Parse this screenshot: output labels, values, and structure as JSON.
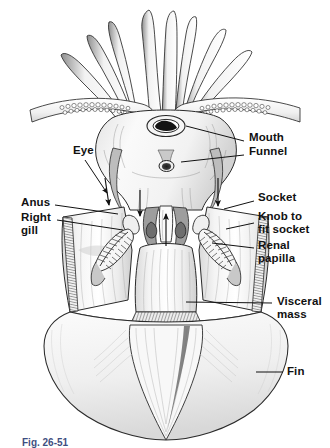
{
  "figure": {
    "caption": "Fig. 26-51",
    "background_color": "#ffffff",
    "ink_color": "#1a1a1a",
    "label_color": "#111111",
    "caption_color": "#1b2f6b"
  },
  "labels": [
    {
      "id": "mouth",
      "text": "Mouth",
      "side": "right",
      "x": 249,
      "y": 136
    },
    {
      "id": "funnel",
      "text": "Funnel",
      "side": "right",
      "x": 249,
      "y": 150
    },
    {
      "id": "eye",
      "text": "Eye",
      "side": "left",
      "x": 73,
      "y": 149
    },
    {
      "id": "anus",
      "text": "Anus",
      "side": "left",
      "x": 21,
      "y": 201
    },
    {
      "id": "right_gill",
      "text": "Right\ngill",
      "side": "left",
      "x": 21,
      "y": 215
    },
    {
      "id": "socket",
      "text": "Socket",
      "side": "right",
      "x": 258,
      "y": 196
    },
    {
      "id": "knob",
      "text": "Knob to\nfit socket",
      "side": "right",
      "x": 258,
      "y": 215
    },
    {
      "id": "renal_papilla",
      "text": "Renal\npapilla",
      "side": "right",
      "x": 258,
      "y": 243
    },
    {
      "id": "visceral_mass",
      "text": "Visceral\nmass",
      "side": "right",
      "x": 277,
      "y": 299
    },
    {
      "id": "fin",
      "text": "Fin",
      "side": "right",
      "x": 287,
      "y": 368
    }
  ],
  "leader_lines": [
    {
      "id": "leader-mouth",
      "from": [
        244,
        141
      ],
      "to": [
        186,
        126
      ],
      "type": "line"
    },
    {
      "id": "leader-funnel",
      "from": [
        244,
        155
      ],
      "to": [
        181,
        162
      ],
      "type": "line"
    },
    {
      "id": "leader-eye",
      "from": [
        85,
        160
      ],
      "to": [
        107,
        194
      ],
      "type": "arrow"
    },
    {
      "id": "leader-anus",
      "from": [
        55,
        205
      ],
      "to": [
        118,
        214
      ],
      "type": "line"
    },
    {
      "id": "leader-rightgill",
      "from": [
        57,
        220
      ],
      "to": [
        123,
        230
      ],
      "type": "line"
    },
    {
      "id": "leader-socket",
      "from": [
        254,
        201
      ],
      "to": [
        224,
        209
      ],
      "type": "line"
    },
    {
      "id": "leader-knob",
      "from": [
        254,
        223
      ],
      "to": [
        226,
        229
      ],
      "type": "line"
    },
    {
      "id": "leader-renal",
      "from": [
        254,
        248
      ],
      "to": [
        212,
        243
      ],
      "type": "line"
    },
    {
      "id": "leader-visceral",
      "from": [
        272,
        303
      ],
      "to": [
        186,
        302
      ],
      "type": "line"
    },
    {
      "id": "leader-fin",
      "from": [
        283,
        372
      ],
      "to": [
        256,
        372
      ],
      "type": "line"
    }
  ],
  "arrows": [
    {
      "id": "arrow-left-mantle",
      "from": [
        105,
        178
      ],
      "to": [
        109,
        205
      ]
    },
    {
      "id": "arrow-center-left",
      "from": [
        140,
        190
      ],
      "to": [
        140,
        216
      ]
    },
    {
      "id": "arrow-center",
      "from": [
        166,
        246
      ],
      "to": [
        166,
        214
      ]
    },
    {
      "id": "arrow-right-mantle",
      "from": [
        218,
        178
      ],
      "to": [
        218,
        206
      ]
    }
  ],
  "anatomy_parts": [
    "arms",
    "tentacle with suckers",
    "mouth",
    "funnel",
    "eye",
    "mantle",
    "anus",
    "right gill",
    "socket",
    "knob to fit socket",
    "renal papilla",
    "visceral mass",
    "fin"
  ]
}
